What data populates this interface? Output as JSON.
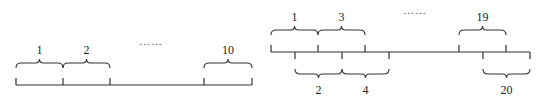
{
  "diagrams": [
    {
      "name": "non-overlapping-segments",
      "baseline": {
        "x1": 16,
        "x2": 252,
        "y": 85
      },
      "ticks": [
        16,
        63,
        110,
        204,
        252
      ],
      "tick_direction": "up",
      "braces": [
        {
          "label": "1",
          "x1": 16,
          "x2": 63,
          "side": "above"
        },
        {
          "label": "2",
          "x1": 63,
          "x2": 110,
          "side": "above"
        },
        {
          "label": "10",
          "x1": 204,
          "x2": 252,
          "side": "above"
        }
      ],
      "ellipsis": {
        "text": "……",
        "x": 151,
        "y": 45
      }
    },
    {
      "name": "overlapping-segments",
      "baseline": {
        "x1": 271,
        "x2": 530,
        "y": 52
      },
      "ticks_up": [
        271,
        318,
        365,
        459,
        506
      ],
      "ticks_down": [
        295,
        342,
        389,
        483,
        530
      ],
      "braces": [
        {
          "label": "1",
          "x1": 271,
          "x2": 318,
          "side": "above"
        },
        {
          "label": "3",
          "x1": 318,
          "x2": 365,
          "side": "above"
        },
        {
          "label": "19",
          "x1": 459,
          "x2": 506,
          "side": "above"
        },
        {
          "label": "2",
          "x1": 295,
          "x2": 342,
          "side": "below"
        },
        {
          "label": "4",
          "x1": 342,
          "x2": 389,
          "side": "below"
        },
        {
          "label": "20",
          "x1": 483,
          "x2": 530,
          "side": "below"
        }
      ],
      "ellipsis": {
        "text": "……",
        "x": 415,
        "y": 14
      }
    }
  ]
}
